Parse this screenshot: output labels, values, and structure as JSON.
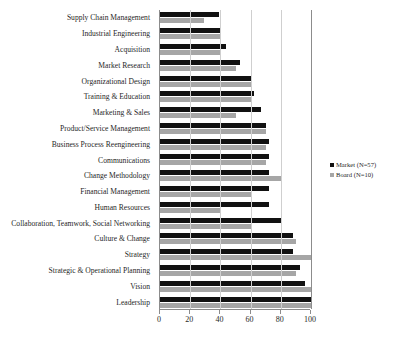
{
  "chart_data": {
    "type": "bar",
    "orientation": "horizontal",
    "title": "",
    "subtitle": "",
    "xlabel": "",
    "ylabel": "",
    "xlim": [
      0,
      100
    ],
    "xticks": [
      0,
      20,
      40,
      60,
      80,
      100
    ],
    "grid": true,
    "legend_position": "right",
    "categories": [
      "Supply Chain Management",
      "Industrial Engineering",
      "Acquisition",
      "Market Research",
      "Organizational Design",
      "Training & Education",
      "Marketing & Sales",
      "Product/Service Management",
      "Business Process Reengineering",
      "Communications",
      "Change Methodology",
      "Financial Management",
      "Human Resources",
      "Collaboration, Teamwork, Social Networking",
      "Culture & Change",
      "Strategy",
      "Strategic & Operational Planning",
      "Vision",
      "Leadership"
    ],
    "series": [
      {
        "name": "Market (N=57)",
        "color": "#111111",
        "values": [
          39,
          40,
          44,
          53,
          61,
          62,
          67,
          70,
          72,
          72,
          72,
          72,
          72,
          81,
          88,
          88,
          93,
          96,
          100
        ]
      },
      {
        "name": "Board (N=10)",
        "color": "#a6a6a6",
        "values": [
          29,
          40,
          40,
          50,
          60,
          60,
          50,
          70,
          70,
          70,
          80,
          60,
          40,
          60,
          90,
          100,
          90,
          100,
          100
        ]
      }
    ]
  },
  "legend": {
    "entries": [
      {
        "label": "Market (N=57)"
      },
      {
        "label": "Board (N=10)"
      }
    ]
  }
}
